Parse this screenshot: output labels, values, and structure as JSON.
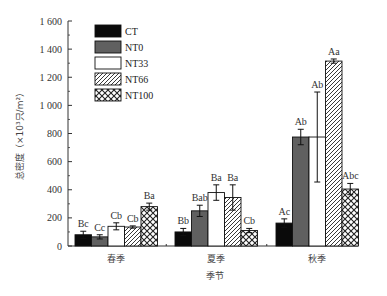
{
  "chart_data": {
    "type": "bar",
    "title": "",
    "xlabel": "季节",
    "ylabel": "总密度（×10³只/m²）",
    "ylim": [
      0,
      1600
    ],
    "yticks": [
      0,
      200,
      400,
      600,
      800,
      1000,
      1200,
      1400,
      1600
    ],
    "ytick_labels": [
      "0",
      "200",
      "400",
      "600",
      "800",
      "1 000",
      "1 200",
      "1 400",
      "1 600"
    ],
    "grid": false,
    "legend_position": "upper-left-inside",
    "categories": [
      "春季",
      "夏季",
      "秋季"
    ],
    "series": [
      {
        "name": "CT",
        "pattern": "solid-black",
        "values": [
          80,
          100,
          163
        ],
        "errors": [
          25,
          25,
          30
        ],
        "labels": [
          "Bc",
          "Bb",
          "Ac"
        ]
      },
      {
        "name": "NT0",
        "pattern": "solid-gray",
        "values": [
          65,
          250,
          775
        ],
        "errors": [
          15,
          40,
          55
        ],
        "labels": [
          "Cc",
          "Bab",
          "Ab"
        ]
      },
      {
        "name": "NT33",
        "pattern": "white",
        "values": [
          140,
          380,
          775
        ],
        "errors": [
          25,
          55,
          320
        ],
        "labels": [
          "Cb",
          "Ba",
          "Ab"
        ]
      },
      {
        "name": "NT66",
        "pattern": "hatched",
        "values": [
          135,
          345,
          1315
        ],
        "errors": [
          8,
          90,
          15
        ],
        "labels": [
          "Cb",
          "Ba",
          "Aa"
        ]
      },
      {
        "name": "NT100",
        "pattern": "crosshatch",
        "values": [
          280,
          110,
          405
        ],
        "errors": [
          25,
          15,
          40
        ],
        "labels": [
          "Ba",
          "Cb",
          "Abc"
        ]
      }
    ]
  },
  "colors": {
    "solid-black": "#0a0a0a",
    "solid-gray": "#606060",
    "white": "#ffffff",
    "axis": "#333333"
  }
}
